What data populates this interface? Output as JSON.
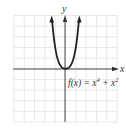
{
  "chart_data": {
    "type": "line",
    "title": "",
    "function_label": "f(x) = x^4 + x^2",
    "label_parts": {
      "prefix": "f(x) = x",
      "exp1": "4",
      "mid": " + x",
      "exp2": "2"
    },
    "xlabel": "x",
    "ylabel": "y",
    "xlim": [
      -5,
      5
    ],
    "ylim": [
      -5,
      5
    ],
    "grid": true,
    "grid_step": 1,
    "series": [
      {
        "name": "f(x) = x^4 + x^2",
        "x": [
          -1.34,
          -1.2,
          -1.0,
          -0.8,
          -0.6,
          -0.4,
          -0.2,
          0,
          0.2,
          0.4,
          0.6,
          0.8,
          1.0,
          1.2,
          1.34
        ],
        "y": [
          5.02,
          3.51,
          2.0,
          1.05,
          0.49,
          0.19,
          0.04,
          0,
          0.04,
          0.19,
          0.49,
          1.05,
          2.0,
          3.51,
          5.02
        ]
      }
    ],
    "colors": {
      "curve": "#222222",
      "axis": "#333333",
      "grid": "#d8d8d8"
    }
  }
}
